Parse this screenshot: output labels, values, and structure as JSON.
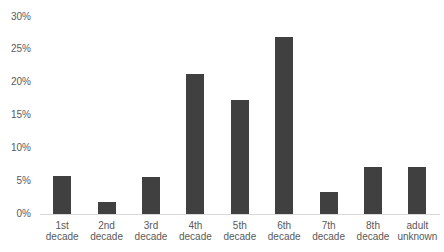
{
  "chart_data": {
    "type": "bar",
    "title": "",
    "xlabel": "",
    "ylabel": "",
    "ylim": [
      0,
      30
    ],
    "yticks": [
      "0%",
      "5%",
      "10%",
      "15%",
      "20%",
      "25%",
      "30%"
    ],
    "grid": false,
    "legend": null,
    "categories": [
      "1st decade",
      "2nd decade",
      "3rd decade",
      "4th decade",
      "5th decade",
      "6th decade",
      "7th decade",
      "8th decade",
      "adult unknown"
    ],
    "category_lines": [
      [
        "1st",
        "decade"
      ],
      [
        "2nd",
        "decade"
      ],
      [
        "3rd",
        "decade"
      ],
      [
        "4th",
        "decade"
      ],
      [
        "5th",
        "decade"
      ],
      [
        "6th",
        "decade"
      ],
      [
        "7th",
        "decade"
      ],
      [
        "8th",
        "decade"
      ],
      [
        "adult",
        "unknown"
      ]
    ],
    "values": [
      5.8,
      1.8,
      5.6,
      21.3,
      17.3,
      27.0,
      3.4,
      7.2,
      7.1
    ],
    "unit": "%",
    "bar_color": "#404040"
  }
}
